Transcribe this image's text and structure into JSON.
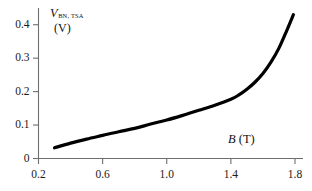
{
  "chart_data": {
    "type": "line",
    "title": "",
    "subtitle": "",
    "xlabel": "B (T)",
    "xlabel_symbol": "B",
    "xlabel_unit": "(T)",
    "ylabel": "V_BN,TSA (V)",
    "ylabel_symbol": "V",
    "ylabel_subscript": "BN, TSA",
    "ylabel_unit": "(V)",
    "xlim": [
      0.2,
      1.85
    ],
    "ylim": [
      0,
      0.45
    ],
    "xticks": [
      "0.2",
      "0.6",
      "1.0",
      "1.4",
      "1.8"
    ],
    "xtick_values": [
      0.2,
      0.6,
      1.0,
      1.4,
      1.8
    ],
    "yticks": [
      "0",
      "0.1",
      "0.2",
      "0.3",
      "0.4"
    ],
    "ytick_values": [
      0,
      0.1,
      0.2,
      0.3,
      0.4
    ],
    "grid": false,
    "legend": null,
    "legend_position": "none",
    "series": [
      {
        "name": "V_BN,TSA",
        "color": "#000000",
        "line_width": 3.2,
        "x": [
          0.3,
          0.4,
          0.5,
          0.6,
          0.7,
          0.8,
          0.9,
          1.0,
          1.1,
          1.2,
          1.3,
          1.4,
          1.45,
          1.5,
          1.55,
          1.6,
          1.65,
          1.7,
          1.75,
          1.79
        ],
        "y": [
          0.032,
          0.046,
          0.058,
          0.069,
          0.08,
          0.09,
          0.103,
          0.115,
          0.129,
          0.144,
          0.159,
          0.177,
          0.19,
          0.207,
          0.228,
          0.254,
          0.288,
          0.33,
          0.384,
          0.43
        ]
      }
    ]
  },
  "axes_style": {
    "axis_color": "#6e6e6e",
    "tick_color": "#6e6e6e",
    "text_color": "#1a1a1a",
    "background": "#ffffff"
  }
}
